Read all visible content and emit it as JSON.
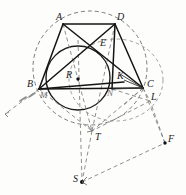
{
  "figure": {
    "type": "geometry-diagram",
    "canvas": {
      "width": 186,
      "height": 195,
      "background": "#fdfdfc"
    },
    "colors": {
      "solid_stroke": "#1a1a1a",
      "dashed_stroke": "#6b6b6b",
      "faint_stroke": "#9a9a9a",
      "label_color": "#1b1b1b",
      "faint_label_color": "#6f6f6f"
    },
    "points": [
      {
        "id": "A",
        "label": "A",
        "x": 63,
        "y": 24,
        "label_x": 56,
        "label_y": 12,
        "dot": false,
        "faint": false
      },
      {
        "id": "D",
        "label": "D",
        "x": 115,
        "y": 24,
        "label_x": 117,
        "label_y": 12,
        "dot": false,
        "faint": false
      },
      {
        "id": "E",
        "label": "E",
        "x": 97,
        "y": 48,
        "label_x": 100,
        "label_y": 38,
        "dot": false,
        "faint": false
      },
      {
        "id": "B",
        "label": "B",
        "x": 39,
        "y": 89,
        "label_x": 27,
        "label_y": 79,
        "dot": false,
        "faint": false
      },
      {
        "id": "C",
        "label": "C",
        "x": 143,
        "y": 88,
        "label_x": 147,
        "label_y": 79,
        "dot": false,
        "faint": false
      },
      {
        "id": "R",
        "label": "R",
        "x": 78,
        "y": 79,
        "label_x": 66,
        "label_y": 70,
        "dot": true,
        "faint": false
      },
      {
        "id": "K",
        "label": "K",
        "x": 124,
        "y": 82,
        "label_x": 117,
        "label_y": 71,
        "dot": false,
        "faint": false
      },
      {
        "id": "M",
        "label": "M",
        "x": 45,
        "y": 92,
        "label_x": 40,
        "label_y": 90,
        "dot": false,
        "faint": true
      },
      {
        "id": "N",
        "label": "N",
        "x": 112,
        "y": 89,
        "label_x": 107,
        "label_y": 88,
        "dot": false,
        "faint": true
      },
      {
        "id": "L",
        "label": "L",
        "x": 150,
        "y": 101,
        "label_x": 151,
        "label_y": 92,
        "dot": false,
        "faint": false
      },
      {
        "id": "T",
        "label": "T",
        "x": 92,
        "y": 130,
        "label_x": 95,
        "label_y": 132,
        "dot": false,
        "faint": false
      },
      {
        "id": "F",
        "label": "F",
        "x": 165,
        "y": 143,
        "label_x": 168,
        "label_y": 134,
        "dot": true,
        "faint": false
      },
      {
        "id": "S",
        "label": "S",
        "x": 82,
        "y": 182,
        "label_x": 73,
        "label_y": 174,
        "dot": true,
        "faint": false
      }
    ],
    "circles": [
      {
        "id": "circumcircle",
        "cx": 90,
        "cy": 68,
        "r": 57,
        "style": "dashed"
      },
      {
        "id": "incircle",
        "cx": 78,
        "cy": 78,
        "r": 32,
        "style": "solid"
      },
      {
        "id": "arc-right-dashed",
        "cx": 118,
        "cy": 78,
        "rx": 46,
        "ry": 40,
        "style": "dashed"
      }
    ],
    "solid_segments": [
      {
        "from": "A",
        "to": "D"
      },
      {
        "from": "A",
        "to": "B"
      },
      {
        "from": "A",
        "to": "C"
      },
      {
        "from": "B",
        "to": "D"
      },
      {
        "from": "B",
        "to": "C"
      },
      {
        "from": "D",
        "to": "C"
      },
      {
        "from": "A",
        "to": "K"
      },
      {
        "from": "D",
        "to": "N"
      }
    ],
    "dashed_segments": [
      {
        "from": "B",
        "to": "lower-left-ray"
      },
      {
        "from": "A",
        "to": "T"
      },
      {
        "from": "D",
        "to": "T"
      },
      {
        "from": "C",
        "to": "T"
      },
      {
        "from": "B",
        "to": "T"
      },
      {
        "from": "R",
        "to": "S"
      },
      {
        "from": "T",
        "to": "S"
      },
      {
        "from": "S",
        "to": "F"
      },
      {
        "from": "F",
        "to": "L"
      },
      {
        "from": "L",
        "to": "T"
      },
      {
        "from": "C",
        "to": "F"
      },
      {
        "from": "C",
        "to": "L"
      }
    ]
  }
}
